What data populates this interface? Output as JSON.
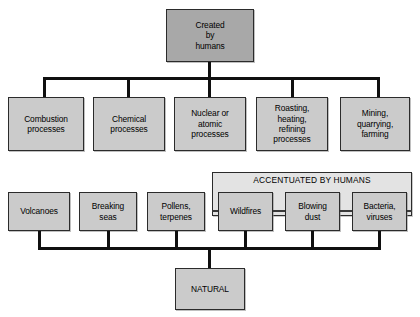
{
  "diagram": {
    "type": "hierarchy-flowchart",
    "colors": {
      "root_fill": "#a8a8a8",
      "node_fill": "#cbcbcb",
      "group_fill": "#e3e3e3",
      "line": "#101010",
      "border": "#2b2b2b",
      "background": "#ffffff"
    },
    "root": {
      "label": "Created\nby\nhumans",
      "line1": "Created",
      "line2": "by",
      "line3": "humans"
    },
    "human_sources": [
      {
        "id": "combustion",
        "line1": "Combustion",
        "line2": "processes",
        "line3": "",
        "line4": ""
      },
      {
        "id": "chemical",
        "line1": "Chemical",
        "line2": "processes",
        "line3": "",
        "line4": ""
      },
      {
        "id": "nuclear",
        "line1": "Nuclear or",
        "line2": "atomic",
        "line3": "processes",
        "line4": ""
      },
      {
        "id": "roasting",
        "line1": "Roasting,",
        "line2": "heating,",
        "line3": "refining",
        "line4": "processes"
      },
      {
        "id": "mining",
        "line1": "Mining,",
        "line2": "quarrying,",
        "line3": "farming",
        "line4": ""
      }
    ],
    "natural_sources": [
      {
        "id": "volcanoes",
        "line1": "Volcanoes",
        "line2": ""
      },
      {
        "id": "breaking-seas",
        "line1": "Breaking",
        "line2": "seas"
      },
      {
        "id": "pollens",
        "line1": "Pollens,",
        "line2": "terpenes"
      }
    ],
    "accentuated_group": {
      "title": "ACCENTUATED BY HUMANS",
      "items": [
        {
          "id": "wildfires",
          "line1": "Wildfires",
          "line2": ""
        },
        {
          "id": "blowing-dust",
          "line1": "Blowing",
          "line2": "dust"
        },
        {
          "id": "bacteria-viruses",
          "line1": "Bacteria,",
          "line2": "viruses"
        }
      ]
    },
    "natural_root": {
      "label": "NATURAL"
    }
  }
}
